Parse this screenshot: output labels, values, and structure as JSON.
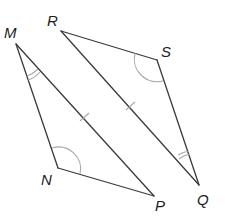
{
  "diagram": {
    "colors": {
      "edge": "#3a3a3a",
      "marking": "#a8a8a8",
      "label": "#1c1c1c"
    },
    "triangles": [
      {
        "name": "MNP",
        "vertices": [
          "M",
          "N",
          "P"
        ]
      },
      {
        "name": "RSQ",
        "vertices": [
          "R",
          "S",
          "Q"
        ]
      }
    ],
    "labels": {
      "M": "M",
      "N": "N",
      "P": "P",
      "R": "R",
      "S": "S",
      "Q": "Q"
    },
    "markings": {
      "single_arc_angles": [
        "N",
        "S"
      ],
      "double_arc_angles": [
        "M",
        "Q"
      ],
      "single_tick_sides": [
        "MP",
        "RQ"
      ]
    }
  }
}
